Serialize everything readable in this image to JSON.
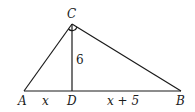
{
  "diagram": {
    "type": "right-triangle-altitude",
    "vertices": {
      "A": {
        "label": "A",
        "x": 24,
        "y": 91
      },
      "B": {
        "label": "B",
        "x": 181,
        "y": 91
      },
      "C": {
        "label": "C",
        "x": 72,
        "y": 24
      },
      "D": {
        "label": "D",
        "x": 72,
        "y": 91
      }
    },
    "segments": [
      {
        "from": "A",
        "to": "C"
      },
      {
        "from": "C",
        "to": "B"
      },
      {
        "from": "A",
        "to": "B"
      },
      {
        "from": "C",
        "to": "D"
      }
    ],
    "labels": {
      "altitude": "6",
      "AD": "x",
      "DB": "x + 5"
    },
    "right_angle_at": "C"
  }
}
